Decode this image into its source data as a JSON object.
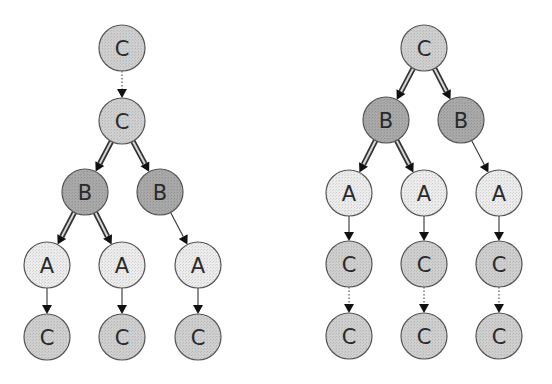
{
  "diagram": {
    "type": "tree-comparison",
    "node_radius": 23,
    "colors": {
      "background": "#ffffff",
      "fill_C": "#cfcfcf",
      "fill_B": "#a9a9a9",
      "fill_A": "#ececec",
      "stroke": "#555555",
      "edge": "#333333",
      "double_edge_inner": "#d8d8d8"
    },
    "edge_styles": {
      "dotted": "dotted single arrow",
      "double": "double (hollow) arrow",
      "single": "thin solid arrow"
    },
    "trees": [
      {
        "id": "left",
        "nodes": [
          {
            "id": "L0",
            "label": "C",
            "kind": "C",
            "x": 122,
            "y": 48
          },
          {
            "id": "L1",
            "label": "C",
            "kind": "C",
            "x": 122,
            "y": 121
          },
          {
            "id": "L2",
            "label": "B",
            "kind": "B",
            "x": 85,
            "y": 192
          },
          {
            "id": "L3",
            "label": "B",
            "kind": "B",
            "x": 160,
            "y": 192
          },
          {
            "id": "L4",
            "label": "A",
            "kind": "A",
            "x": 47,
            "y": 265
          },
          {
            "id": "L5",
            "label": "A",
            "kind": "A",
            "x": 122,
            "y": 265
          },
          {
            "id": "L6",
            "label": "A",
            "kind": "A",
            "x": 198,
            "y": 265
          },
          {
            "id": "L7",
            "label": "C",
            "kind": "C",
            "x": 47,
            "y": 337
          },
          {
            "id": "L8",
            "label": "C",
            "kind": "C",
            "x": 122,
            "y": 337
          },
          {
            "id": "L9",
            "label": "C",
            "kind": "C",
            "x": 198,
            "y": 337
          }
        ],
        "edges": [
          {
            "from": "L0",
            "to": "L1",
            "style": "dotted"
          },
          {
            "from": "L1",
            "to": "L2",
            "style": "double"
          },
          {
            "from": "L1",
            "to": "L3",
            "style": "double"
          },
          {
            "from": "L2",
            "to": "L4",
            "style": "double"
          },
          {
            "from": "L2",
            "to": "L5",
            "style": "double"
          },
          {
            "from": "L3",
            "to": "L6",
            "style": "single"
          },
          {
            "from": "L4",
            "to": "L7",
            "style": "single"
          },
          {
            "from": "L5",
            "to": "L8",
            "style": "single"
          },
          {
            "from": "L6",
            "to": "L9",
            "style": "single"
          }
        ]
      },
      {
        "id": "right",
        "nodes": [
          {
            "id": "R0",
            "label": "C",
            "kind": "C",
            "x": 424,
            "y": 48
          },
          {
            "id": "R1",
            "label": "B",
            "kind": "B",
            "x": 386,
            "y": 120
          },
          {
            "id": "R2",
            "label": "B",
            "kind": "B",
            "x": 461,
            "y": 120
          },
          {
            "id": "R3",
            "label": "A",
            "kind": "A",
            "x": 349,
            "y": 193
          },
          {
            "id": "R4",
            "label": "A",
            "kind": "A",
            "x": 424,
            "y": 193
          },
          {
            "id": "R5",
            "label": "A",
            "kind": "A",
            "x": 499,
            "y": 193
          },
          {
            "id": "R6",
            "label": "C",
            "kind": "C",
            "x": 349,
            "y": 264
          },
          {
            "id": "R7",
            "label": "C",
            "kind": "C",
            "x": 424,
            "y": 264
          },
          {
            "id": "R8",
            "label": "C",
            "kind": "C",
            "x": 499,
            "y": 264
          },
          {
            "id": "R9",
            "label": "C",
            "kind": "C",
            "x": 349,
            "y": 336
          },
          {
            "id": "R10",
            "label": "C",
            "kind": "C",
            "x": 424,
            "y": 336
          },
          {
            "id": "R11",
            "label": "C",
            "kind": "C",
            "x": 499,
            "y": 336
          }
        ],
        "edges": [
          {
            "from": "R0",
            "to": "R1",
            "style": "double"
          },
          {
            "from": "R0",
            "to": "R2",
            "style": "double"
          },
          {
            "from": "R1",
            "to": "R3",
            "style": "double"
          },
          {
            "from": "R1",
            "to": "R4",
            "style": "double"
          },
          {
            "from": "R2",
            "to": "R5",
            "style": "single"
          },
          {
            "from": "R3",
            "to": "R6",
            "style": "single"
          },
          {
            "from": "R4",
            "to": "R7",
            "style": "single"
          },
          {
            "from": "R5",
            "to": "R8",
            "style": "single"
          },
          {
            "from": "R6",
            "to": "R9",
            "style": "dotted"
          },
          {
            "from": "R7",
            "to": "R10",
            "style": "dotted"
          },
          {
            "from": "R8",
            "to": "R11",
            "style": "dotted"
          }
        ]
      }
    ]
  }
}
